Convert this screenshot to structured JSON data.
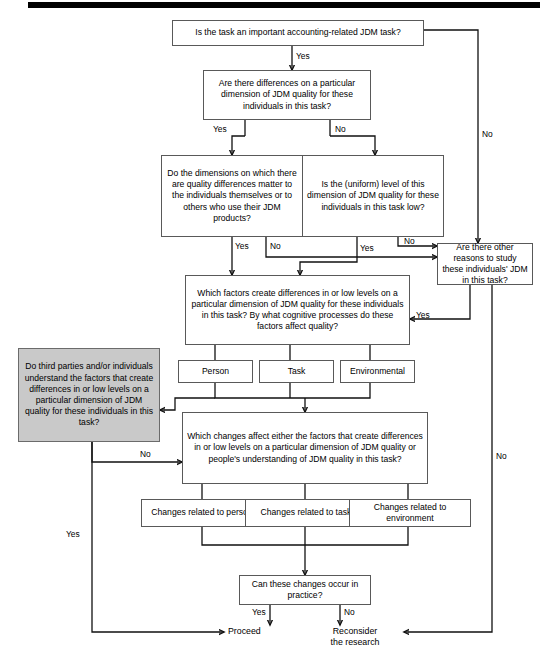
{
  "figure": {
    "colors": {
      "line": "#111111",
      "box_border": "#595959",
      "highlight_fill": "#c9c9c9",
      "rule": "#000000"
    }
  },
  "nodes": {
    "q1": "Is the task an important accounting-related JDM task?",
    "q2": "Are there differences on a particular dimension of JDM quality for these individuals in this task?",
    "q3_left": "Do the dimensions on which there are quality differences matter to the individuals themselves or to others who use their JDM products?",
    "q3_right": "Is the (uniform) level of this dimension of JDM quality for these individuals in this task low?",
    "q_other": "Are there other reasons to study these individuals' JDM in this task?",
    "q_factors": "Which factors create differences in or low levels on a particular dimension of JDM quality for these individuals in this task? By what cognitive processes do these factors affect quality?",
    "f_person": "Person",
    "f_task": "Task",
    "f_environmental": "Environmental",
    "q_understand": "Do third parties and/or individuals understand the factors that create differences in or low levels on a particular dimension of JDM quality for these individuals in this task?",
    "q_changes": "Which changes affect either the factors that create differences in or low levels on a particular dimension of JDM quality or people's understanding of JDM quality in this task?",
    "c_person": "Changes related to person",
    "c_task": "Changes related to task",
    "c_environment": "Changes related to environment",
    "q_practice": "Can these changes occur in practice?"
  },
  "terminals": {
    "proceed": "Proceed",
    "reconsider_line1": "Reconsider",
    "reconsider_line2": "the research"
  },
  "edge_labels": {
    "q1_yes": "Yes",
    "q1_no": "No",
    "q2_yes": "Yes",
    "q2_no": "No",
    "q3left_yes": "Yes",
    "q3left_no": "No",
    "q3right_yes": "Yes",
    "q3right_no": "No",
    "other_yes": "Yes",
    "other_no": "No",
    "understand_no": "No",
    "understand_yes": "Yes",
    "practice_yes": "Yes",
    "practice_no": "No"
  }
}
